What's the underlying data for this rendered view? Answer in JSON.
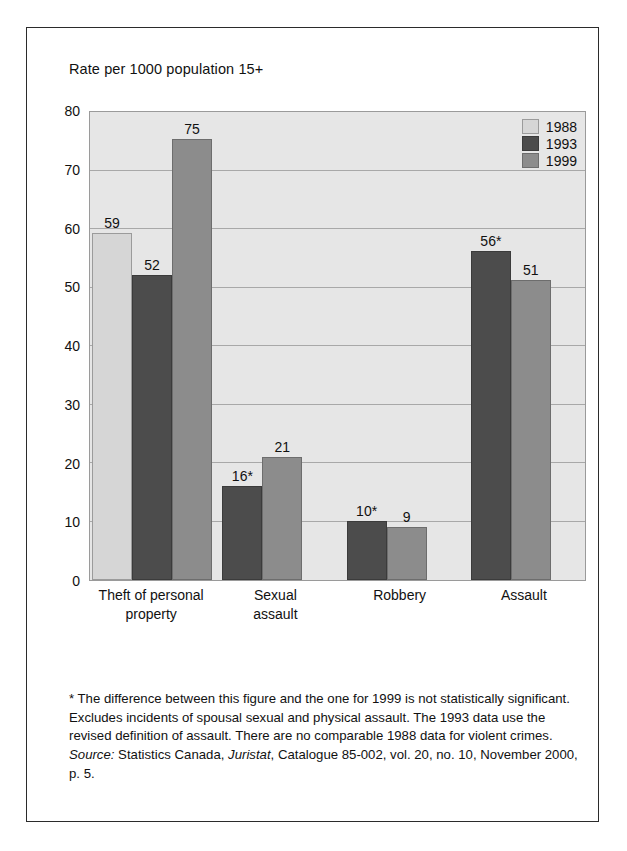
{
  "figure": {
    "title": "Rate per 1000 population 15+"
  },
  "chart_data": {
    "type": "bar",
    "title": "Rate per 1000 population 15+",
    "xlabel": "",
    "ylabel": "Rate per 1000 population 15+",
    "ylim": [
      0,
      80
    ],
    "yticks": [
      0,
      10,
      20,
      30,
      40,
      50,
      60,
      70,
      80
    ],
    "ytick_labels": [
      "0",
      "10",
      "20",
      "30",
      "40",
      "50",
      "60",
      "70",
      "80"
    ],
    "grid": true,
    "legend_position": "top-right",
    "categories": [
      "Theft of personal property",
      "Sexual assault",
      "Robbery",
      "Assault"
    ],
    "category_lines": [
      [
        "Theft of personal",
        "property"
      ],
      [
        "Sexual",
        "assault"
      ],
      [
        "Robbery"
      ],
      [
        "Assault"
      ]
    ],
    "series": [
      {
        "name": "1988",
        "color": "#d6d6d6",
        "values": [
          59,
          null,
          null,
          null
        ],
        "labels": [
          "59",
          "",
          "",
          ""
        ]
      },
      {
        "name": "1993",
        "color": "#4c4c4c",
        "values": [
          52,
          16,
          10,
          56
        ],
        "labels": [
          "52",
          "16*",
          "10*",
          "56*"
        ]
      },
      {
        "name": "1999",
        "color": "#8c8c8c",
        "values": [
          75,
          21,
          9,
          51
        ],
        "labels": [
          "75",
          "21",
          "9",
          "51"
        ]
      }
    ],
    "annotations": [
      "* The difference between this figure and the one for 1999 is not statistically significant.",
      "Excludes incidents of spousal sexual and physical assault.",
      "The 1993 data use the revised definition of assault.",
      "There are no comparable 1988 data for violent crimes."
    ]
  },
  "legend": {
    "items": [
      {
        "label": "1988",
        "color": "#d6d6d6"
      },
      {
        "label": "1993",
        "color": "#4c4c4c"
      },
      {
        "label": "1999",
        "color": "#8c8c8c"
      }
    ]
  },
  "notes": {
    "footnote": "* The difference between this figure and the one for 1999 is not statistically significant.  Excludes incidents of spousal sexual and physical assault. The 1993 data use the revised definition of assault. There are no comparable 1988 data for violent crimes.",
    "source_prefix": "Source:",
    "source_part1": " Statistics Canada, ",
    "source_publication": "Juristat",
    "source_part2": ", Catalogue 85-002, vol. 20, no. 10, November 2000, p. 5."
  }
}
